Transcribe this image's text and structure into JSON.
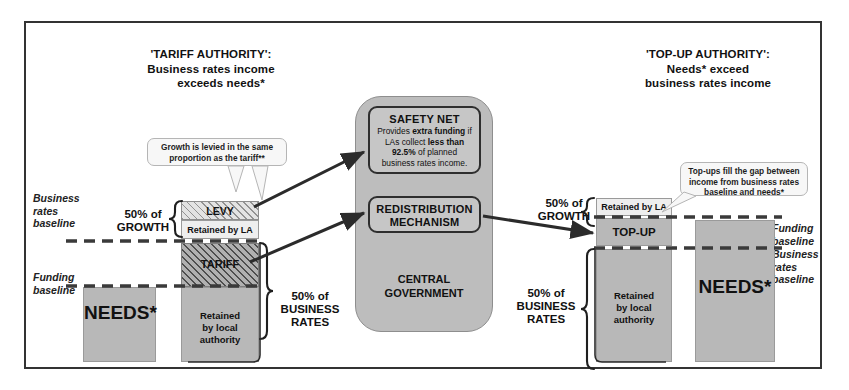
{
  "diagram": {
    "left_section": {
      "heading_line1": "'TARIFF AUTHORITY':",
      "heading_line2": "Business rates income",
      "heading_line3": "exceeds needs*",
      "axis_business_rates_baseline": "Business\nrates\nbaseline",
      "axis_funding_baseline": "Funding\nbaseline",
      "annot_growth": "50% of\nGROWTH",
      "annot_business_rates": "50% of\nBUSINESS\nRATES",
      "needs_bar_label": "NEEDS*",
      "levy_label": "LEVY",
      "retained_by_la_label": "Retained by LA",
      "tariff_label": "TARIFF",
      "retained_local_authority_label": "Retained\nby local\nauthority",
      "callout": "Growth is levied in the same proportion as the tariff**"
    },
    "centre_section": {
      "safety_net_title": "SAFETY NET",
      "safety_net_body_1": "Provides ",
      "safety_net_body_bold_1": "extra funding",
      "safety_net_body_2": " if LAs collect ",
      "safety_net_body_bold_2": "less than",
      "safety_net_body_3": " ",
      "safety_net_body_bold_3": "92.5%",
      "safety_net_body_4": " of planned business rates income.",
      "redistribution_title_line1": "REDISTRIBUTION",
      "redistribution_title_line2": "MECHANISM",
      "central_government_line1": "CENTRAL",
      "central_government_line2": "GOVERNMENT"
    },
    "right_section": {
      "heading_line1": "'TOP-UP AUTHORITY':",
      "heading_line2": "Needs* exceed",
      "heading_line3": "business rates income",
      "axis_funding_baseline": "Funding\nbaseline",
      "axis_business_rates_baseline": "Business\nrates\nbaseline",
      "annot_growth": "50% of\nGROWTH",
      "annot_business_rates": "50% of\nBUSINESS\nRATES",
      "retained_by_la_label": "Retained by LA",
      "top_up_label": "TOP-UP",
      "retained_local_authority_label": "Retained\nby local\nauthority",
      "needs_bar_label": "NEEDS*",
      "callout": "Top-ups fill the gap between income from business rates baseline and needs*"
    },
    "colors": {
      "bar_grey": "#b8b8b8",
      "panel_grey": "#bdbdbd",
      "outline": "#333333",
      "dash": "#3a3a3a",
      "callout_bg": "#f7f7f7"
    }
  }
}
